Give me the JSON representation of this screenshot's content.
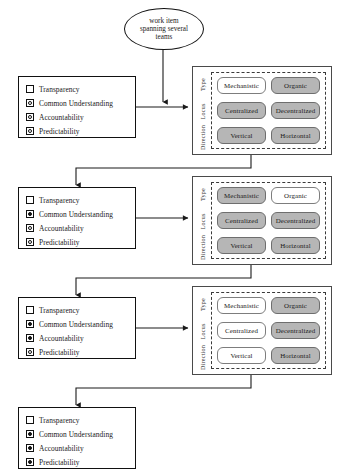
{
  "diagram": {
    "source_node": {
      "name": "source-oval",
      "lines": [
        "work item",
        "spanning several",
        "teams"
      ],
      "text": "work item spanning several teams"
    },
    "checklist_items": [
      "Transparency",
      "Common Understanding",
      "Accountability",
      "Predictability"
    ],
    "matrix_axis_labels": [
      "Type",
      "Locus",
      "Direction"
    ],
    "matrix_row_options": [
      [
        "Mechanistic",
        "Organic"
      ],
      [
        "Centralized",
        "Decentralized"
      ],
      [
        "Vertical",
        "Horizontal"
      ]
    ],
    "stages": [
      {
        "id": "stage-1",
        "checklist_states": [
          "empty",
          "ring",
          "ring",
          "ring"
        ],
        "matrix_states": [
          [
            "on",
            "on"
          ],
          [
            "on",
            "on"
          ],
          [
            "on",
            "on"
          ]
        ],
        "matrix_highlight": [
          [
            "off",
            "on"
          ],
          [
            "on",
            "on"
          ],
          [
            "on",
            "on"
          ]
        ]
      },
      {
        "id": "stage-2",
        "checklist_states": [
          "empty",
          "filled",
          "ring",
          "ring"
        ],
        "matrix_highlight": [
          [
            "on",
            "off"
          ],
          [
            "on",
            "on"
          ],
          [
            "on",
            "on"
          ]
        ]
      },
      {
        "id": "stage-3",
        "checklist_states": [
          "empty",
          "filled",
          "filled",
          "ring"
        ],
        "matrix_highlight": [
          [
            "off",
            "on"
          ],
          [
            "off",
            "on"
          ],
          [
            "off",
            "on"
          ]
        ]
      },
      {
        "id": "stage-4",
        "checklist_states": [
          "empty",
          "filled",
          "filled",
          "filled"
        ],
        "matrix_highlight": null
      }
    ],
    "colors": {
      "selected_cell_fill": "#b6b6b6",
      "unselected_cell_fill": "#ffffff",
      "cell_border": "#7d7d7d",
      "panel_border": "#4a4a4a",
      "line": "#1a1a1a"
    }
  }
}
